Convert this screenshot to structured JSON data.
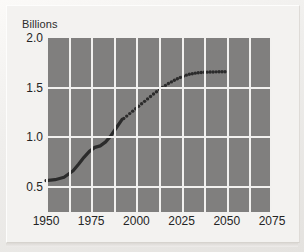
{
  "chart_data": {
    "type": "line",
    "title": "Billions",
    "xlabel": "",
    "ylabel": "Billions",
    "xlim": [
      1950,
      2075
    ],
    "ylim": [
      0.25,
      2.0
    ],
    "grid": true,
    "legend": "none",
    "x_ticks": [
      "1950",
      "1975",
      "2000",
      "2025",
      "2050",
      "2075"
    ],
    "x_tick_values": [
      1950,
      1975,
      2000,
      2025,
      2050,
      2075
    ],
    "y_ticks": [
      "2.0",
      "1.5",
      "1.0",
      "0.5"
    ],
    "y_tick_values": [
      2.0,
      1.5,
      1.0,
      0.5
    ],
    "x_gridline_values": [
      1950,
      1962.5,
      1975,
      1987.5,
      2000,
      2012.5,
      2025,
      2037.5,
      2050,
      2062.5,
      2075
    ],
    "y_gridline_values": [
      1.5,
      1.0,
      0.5
    ],
    "colors": {
      "plot_background": "#807f7e",
      "gridline": "#f2f1ef",
      "series_line": "#2b2b2b",
      "page_background": "#efeeec",
      "text": "#242424"
    },
    "series": [
      {
        "name": "Observed",
        "style": "solid",
        "x": [
          1950,
          1955,
          1960,
          1965,
          1968,
          1971,
          1974,
          1977,
          1980,
          1983,
          1986,
          1989,
          1992
        ],
        "values": [
          0.565,
          0.575,
          0.6,
          0.665,
          0.73,
          0.8,
          0.86,
          0.9,
          0.915,
          0.955,
          1.02,
          1.1,
          1.18
        ]
      },
      {
        "name": "Projected",
        "style": "dotted",
        "x": [
          1993,
          1997,
          2001,
          2005,
          2009,
          2013,
          2017,
          2021,
          2025,
          2029,
          2033,
          2037,
          2041,
          2045,
          2049
        ],
        "values": [
          1.19,
          1.25,
          1.31,
          1.37,
          1.43,
          1.485,
          1.535,
          1.575,
          1.61,
          1.635,
          1.648,
          1.655,
          1.658,
          1.66,
          1.66
        ]
      }
    ]
  }
}
